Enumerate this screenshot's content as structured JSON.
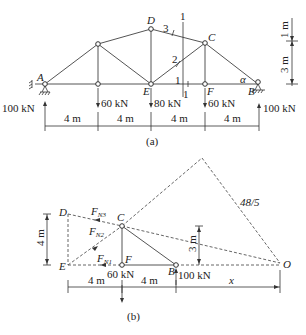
{
  "figure_a": {
    "caption": "(a)",
    "nodes": {
      "A": "A",
      "B": "B",
      "C": "C",
      "D": "D",
      "E": "E",
      "F": "F"
    },
    "section_labels": [
      "1",
      "1",
      "1",
      "2",
      "3"
    ],
    "angle_label": "α",
    "loads": {
      "left_reaction": "100 kN",
      "p1": "60 kN",
      "p2": "80 kN",
      "p3": "60 kN",
      "right_reaction": "100 kN"
    },
    "spans": [
      "4 m",
      "4 m",
      "4 m",
      "4 m"
    ],
    "height_dims": [
      "1 m",
      "3 m"
    ]
  },
  "figure_b": {
    "caption": "(b)",
    "nodes": {
      "D": "D",
      "C": "C",
      "E": "E",
      "F": "F",
      "B": "B",
      "O": "O"
    },
    "forces": {
      "fn3": "F",
      "fn3_sub": "N3",
      "fn2": "F",
      "fn2_sub": "N2",
      "fn1": "F",
      "fn1_sub": "N1"
    },
    "loads": {
      "f_load": "60 kN",
      "b_reaction": "100 kN"
    },
    "dims": {
      "left_height": "4 m",
      "c_height": "3 m",
      "span1": "4 m",
      "span2": "4 m",
      "x": "x",
      "arm": "48/5"
    }
  }
}
